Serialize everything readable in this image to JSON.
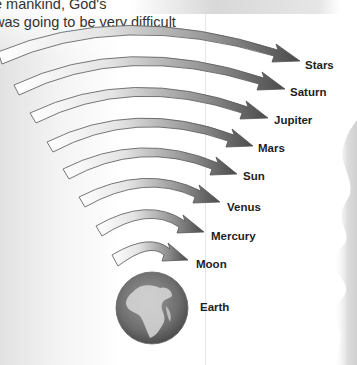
{
  "intro_text": {
    "line1": "e mankind, God's",
    "line2": "was going to be very difficult"
  },
  "diagram": {
    "type": "concentric-arrows",
    "arrow_fill_start": "#ffffff",
    "arrow_fill_end": "#555555",
    "arrow_stroke": "#444444",
    "center_body": {
      "name": "Earth",
      "icon": "globe-icon"
    },
    "spheres": [
      {
        "name": "Moon"
      },
      {
        "name": "Mercury"
      },
      {
        "name": "Venus"
      },
      {
        "name": "Sun"
      },
      {
        "name": "Mars"
      },
      {
        "name": "Jupiter"
      },
      {
        "name": "Saturn"
      },
      {
        "name": "Stars"
      }
    ]
  },
  "labels": {
    "stars": "Stars",
    "saturn": "Saturn",
    "jupiter": "Jupiter",
    "mars": "Mars",
    "sun": "Sun",
    "venus": "Venus",
    "mercury": "Mercury",
    "moon": "Moon",
    "earth": "Earth"
  }
}
